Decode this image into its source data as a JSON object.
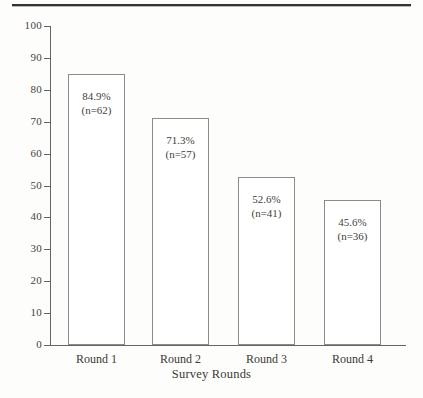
{
  "page": {
    "background_color": "#fdfdfc",
    "rule_color": "#33332f",
    "header_remnant": ""
  },
  "chart_data": {
    "type": "bar",
    "title": "",
    "subtitle": "",
    "xlabel": "Survey Rounds",
    "ylabel": "",
    "categories": [
      "Round 1",
      "Round 2",
      "Round 3",
      "Round 4"
    ],
    "values": [
      84.9,
      71.3,
      52.6,
      45.6
    ],
    "counts": [
      62,
      57,
      41,
      36
    ],
    "data_labels": [
      {
        "percent": "84.9%",
        "n": "(n=62)"
      },
      {
        "percent": "71.3%",
        "n": "(n=57)"
      },
      {
        "percent": "52.6%",
        "n": "(n=41)"
      },
      {
        "percent": "45.6%",
        "n": "(n=36)"
      }
    ],
    "ylim": [
      0,
      100
    ],
    "ytick_step": 10,
    "ytick_labels": [
      "100",
      "90",
      "80",
      "70",
      "60",
      "50",
      "40",
      "30",
      "20",
      "10",
      "0"
    ],
    "ytick_values": [
      100,
      90,
      80,
      70,
      60,
      50,
      40,
      30,
      20,
      10,
      0
    ],
    "grid": false,
    "legend": null,
    "bar_fill_color": "#ffffff",
    "bar_edge_color": "#8c8c86",
    "axis_color": "#66665f",
    "text_color": "#3a3a35"
  }
}
